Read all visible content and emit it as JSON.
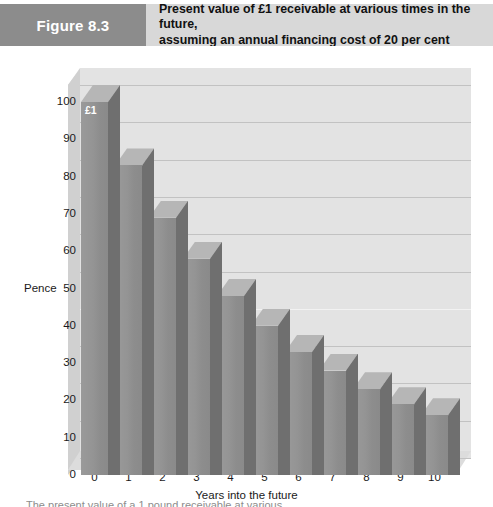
{
  "header": {
    "figure_badge": "Figure 8.3",
    "title_line1": "Present value of £1 receivable at various times in the future,",
    "title_line2": "assuming an annual financing cost of 20 per cent",
    "badge_color": "#8c8c8c",
    "bar_color": "#d8d8d8"
  },
  "caption": "The present value of a 1 pound receivable at various",
  "chart_data": {
    "type": "bar",
    "title": "Present value of £1 receivable at various times in the future, assuming an annual financing cost of 20 per cent",
    "xlabel": "Years into the future",
    "ylabel": "Pence",
    "categories": [
      "0",
      "1",
      "2",
      "3",
      "4",
      "5",
      "6",
      "7",
      "8",
      "9",
      "10"
    ],
    "values": [
      100,
      83,
      69,
      58,
      48,
      40,
      33,
      28,
      23,
      19,
      16
    ],
    "ylim": [
      0,
      100
    ],
    "yticks": [
      0,
      10,
      20,
      30,
      40,
      50,
      60,
      70,
      80,
      90,
      100
    ],
    "ytick_labels": [
      "0",
      "10",
      "20",
      "30",
      "40",
      "50",
      "60",
      "70",
      "80",
      "90",
      "100"
    ],
    "grid": true,
    "legend": false,
    "annotations": [
      {
        "series_index": 0,
        "text": "£1"
      }
    ],
    "colors": {
      "bar_front": "#949494",
      "bar_side": "#6f6f6f",
      "bar_top": "#b6b6b6",
      "plot_background": "#e3e3e3",
      "gridline": "#c2c2c2"
    }
  }
}
